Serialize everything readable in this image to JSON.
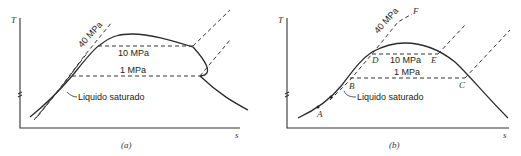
{
  "panels": [
    {
      "id": "a",
      "caption": "(a)",
      "y_axis_label": "T",
      "x_axis_label": "s",
      "isobars": [
        "40 MPa",
        "10 MPa",
        "1 MPa"
      ],
      "annotation": "Liquido saturado"
    },
    {
      "id": "b",
      "caption": "(b)",
      "y_axis_label": "T",
      "x_axis_label": "s",
      "isobars": [
        "40 MPa",
        "10 MPa",
        "1 MPa"
      ],
      "annotation": "Liquido saturado",
      "points": [
        "A",
        "B",
        "C",
        "D",
        "E",
        "F"
      ]
    }
  ],
  "colors": {
    "line": "#2a2a2a",
    "background": "#ffffff"
  }
}
